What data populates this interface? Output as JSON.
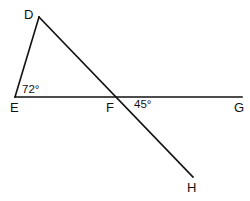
{
  "diagram": {
    "type": "geometry",
    "stroke_color": "#111111",
    "background": "#ffffff",
    "points": {
      "D": {
        "label": "D",
        "x": 39,
        "y": 17
      },
      "E": {
        "label": "E",
        "x": 15,
        "y": 97
      },
      "F": {
        "label": "F",
        "x": 119,
        "y": 97
      },
      "G": {
        "label": "G",
        "x": 242,
        "y": 97
      },
      "H": {
        "label": "H",
        "x": 193,
        "y": 177
      }
    },
    "segments": [
      {
        "from": "D",
        "to": "E"
      },
      {
        "from": "E",
        "to": "G"
      },
      {
        "from": "D",
        "to": "H"
      }
    ],
    "angles": {
      "E": {
        "vertex": "E",
        "value": "72°"
      },
      "F": {
        "vertex": "F",
        "value": "45°"
      }
    }
  }
}
